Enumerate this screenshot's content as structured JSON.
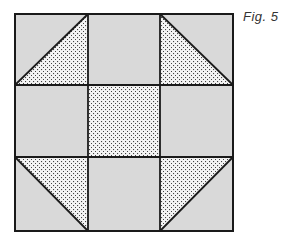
{
  "caption": "Fig. 5",
  "diagram": {
    "type": "quilt-block",
    "grid": "3x3",
    "colors": {
      "solid": "#d9d9d9",
      "dotted_bg": "#f4f4f4",
      "dot": "#444444",
      "line": "#1a1a1a"
    },
    "cells": [
      {
        "row": 0,
        "col": 0,
        "kind": "half-square-triangle",
        "dotted": "lower-right",
        "diagonal": "bottom-left-to-top-right"
      },
      {
        "row": 0,
        "col": 1,
        "kind": "solid"
      },
      {
        "row": 0,
        "col": 2,
        "kind": "half-square-triangle",
        "dotted": "lower-left",
        "diagonal": "top-left-to-bottom-right"
      },
      {
        "row": 1,
        "col": 0,
        "kind": "solid"
      },
      {
        "row": 1,
        "col": 1,
        "kind": "dotted"
      },
      {
        "row": 1,
        "col": 2,
        "kind": "solid"
      },
      {
        "row": 2,
        "col": 0,
        "kind": "half-square-triangle",
        "dotted": "upper-right",
        "diagonal": "top-left-to-bottom-right"
      },
      {
        "row": 2,
        "col": 1,
        "kind": "solid"
      },
      {
        "row": 2,
        "col": 2,
        "kind": "half-square-triangle",
        "dotted": "upper-left",
        "diagonal": "bottom-left-to-top-right"
      }
    ]
  }
}
